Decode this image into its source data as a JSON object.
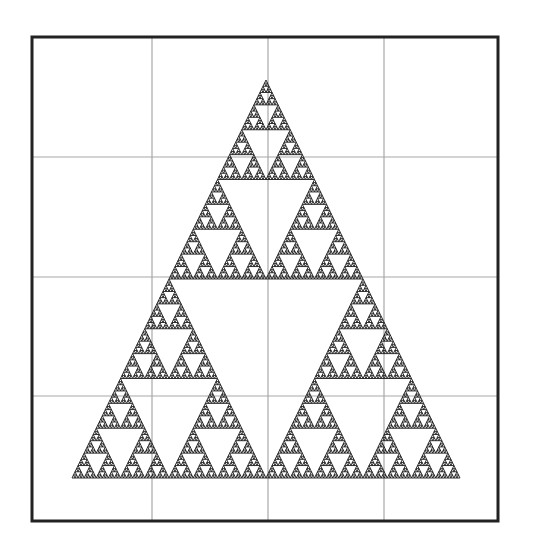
{
  "figure": {
    "type": "sierpinski-triangle",
    "depth": 7,
    "colors": {
      "background": "#ffffff",
      "frame": "#222222",
      "grid": "#a8a8a8",
      "fractal": "#1a1a1a"
    },
    "frame": {
      "x": 32,
      "y": 37,
      "width": 466,
      "height": 484
    },
    "grid": {
      "vertical_lines_x": [
        152,
        268,
        384
      ],
      "horizontal_lines_y": [
        157,
        277,
        396
      ]
    },
    "triangle": {
      "apex": [
        266,
        80
      ],
      "base_left": [
        72,
        478
      ],
      "base_right": [
        460,
        478
      ]
    }
  }
}
